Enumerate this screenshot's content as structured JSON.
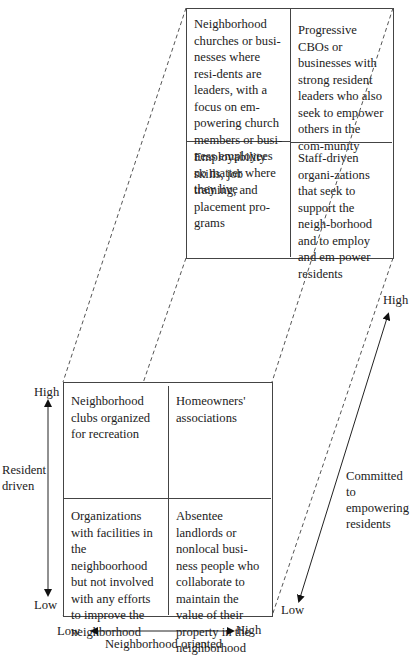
{
  "diagram": {
    "upper_matrix": {
      "top_left": "Neighborhood churches or busi-nesses where resi-dents are leaders, with a focus on em-powering church members or busi-ness employees no matter where they live",
      "top_right": "Progressive CBOs or businesses with strong resident leaders who also seek to empower others in the com-munity",
      "bottom_left": "Employability skills, job training, and placement pro-grams",
      "bottom_right": "Staff-driven organi-zations that seek to support the neigh-borhood and to employ and em-power residents"
    },
    "lower_matrix": {
      "top_left": "Neighborhood clubs organized for recreation",
      "top_right": "Homeowners' associations",
      "bottom_left": "Organizations with facilities in the neighboorhood but not involved with any efforts to improve the neighborhood",
      "bottom_right": "Absentee landlords or nonlocal busi-ness people who collaborate to maintain the value of their property in the neighborhood"
    },
    "axes": {
      "vertical": {
        "label_line1": "Resident",
        "label_line2": "driven",
        "high": "High",
        "low": "Low"
      },
      "horizontal": {
        "label": "Neighborhood oriented",
        "high": "High",
        "low": "Low"
      },
      "depth": {
        "label_line1": "Committed to",
        "label_line2": "empowering",
        "label_line3": "residents",
        "high": "High",
        "low": "Low"
      }
    }
  }
}
